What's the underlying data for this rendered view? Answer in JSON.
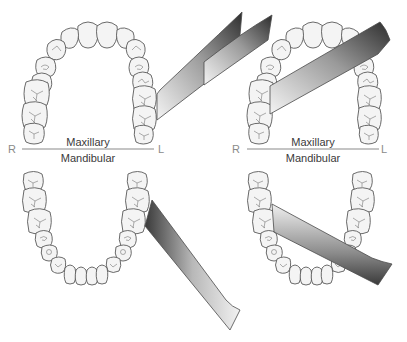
{
  "diagram": {
    "panels": [
      {
        "id": "left",
        "labels": {
          "right_side": "R",
          "left_side": "L",
          "upper_arch": "Maxillary",
          "lower_arch": "Mandibular"
        },
        "instruments": [
          {
            "arch": "maxillary",
            "position": "left posterior, buccal aspect",
            "direction": "extends up-right"
          },
          {
            "arch": "mandibular",
            "position": "left posterior, buccal aspect",
            "direction": "extends down-right"
          }
        ]
      },
      {
        "id": "right",
        "labels": {
          "right_side": "R",
          "left_side": "L",
          "upper_arch": "Maxillary",
          "lower_arch": "Mandibular"
        },
        "instruments": [
          {
            "arch": "maxillary",
            "position": "right posterior, lingual/palatal aspect",
            "direction": "extends up-right across arch"
          },
          {
            "arch": "mandibular",
            "position": "right posterior, lingual aspect",
            "direction": "extends down-right across arch"
          }
        ]
      }
    ],
    "colors": {
      "tooth_fill": "#f4f4f4",
      "tooth_outline": "#5a5a5a",
      "instrument_dark": "#3c3c3c",
      "instrument_light": "#f2f2f2",
      "divider": "#8a8a8a"
    }
  }
}
